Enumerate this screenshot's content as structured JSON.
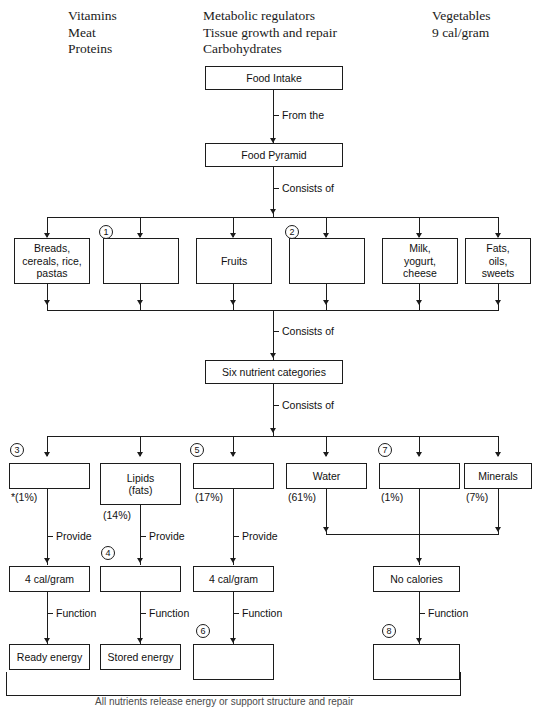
{
  "word_bank": {
    "column_1": "Vitamins\nMeat\nProteins",
    "column_2": "Metabolic regulators\nTissue growth and repair\nCarbohydrates",
    "column_3": "Vegetables\n9 cal/gram"
  },
  "nodes": {
    "food_intake": "Food Intake",
    "food_pyramid": "Food Pyramid",
    "six_nutrient_categories": "Six nutrient categories",
    "group_breads": "Breads,\ncereals, rice,\npastas",
    "group_blank_1": "",
    "group_fruits": "Fruits",
    "group_blank_2": "",
    "group_milk": "Milk,\nyogurt,\ncheese",
    "group_fats": "Fats,\noils,\nsweets",
    "nutrient_blank_3": "",
    "nutrient_lipids": "Lipids\n(fats)",
    "nutrient_blank_5": "",
    "nutrient_water": "Water",
    "nutrient_blank_7": "",
    "nutrient_minerals": "Minerals",
    "cal_left": "4 cal/gram",
    "cal_blank_4": "",
    "cal_mid": "4 cal/gram",
    "cal_none": "No calories",
    "fn_ready": "Ready energy",
    "fn_stored": "Stored energy",
    "fn_blank_6": "",
    "fn_blank_8": ""
  },
  "percentages": {
    "blank_3": "*(1%)",
    "lipids": "(14%)",
    "blank_5": "(17%)",
    "water": "(61%)",
    "blank_7": "(1%)",
    "minerals": "(7%)"
  },
  "edge_labels": {
    "from_the": "From the",
    "consists_of_1": "Consists of",
    "consists_of_2": "Consists of",
    "consists_of_3": "Consists of",
    "provide_1": "Provide",
    "provide_2": "Provide",
    "provide_3": "Provide",
    "function_1": "Function",
    "function_2": "Function",
    "function_3": "Function",
    "function_4": "Function"
  },
  "blank_numbers": {
    "n1": "1",
    "n2": "2",
    "n3": "3",
    "n4": "4",
    "n5": "5",
    "n6": "6",
    "n7": "7",
    "n8": "8"
  },
  "footnote": "All nutrients release energy or support structure and repair",
  "colors": {
    "ink": "#1c1c1c",
    "paper": "#ffffff",
    "text": "#111111"
  }
}
